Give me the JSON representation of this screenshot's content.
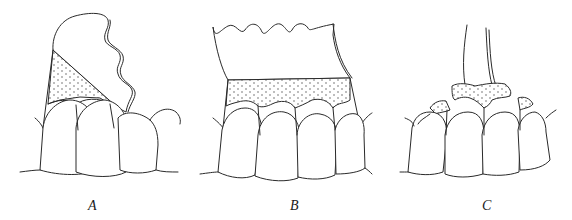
{
  "figure": {
    "panels": [
      {
        "id": "A",
        "label": "A",
        "description": "Shell partially seated at an angle over teeth, stippled material filling triangular region"
      },
      {
        "id": "B",
        "label": "B",
        "description": "Scalloped shell seated horizontally over teeth, stippled band across gingival area"
      },
      {
        "id": "C",
        "label": "C",
        "description": "Instrument removing excess stippled material from interproximal areas"
      }
    ],
    "colors": {
      "line": "#2a2a2a",
      "background": "#ffffff"
    }
  }
}
